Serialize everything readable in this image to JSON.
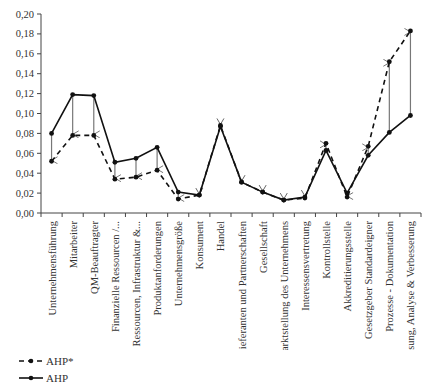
{
  "chart_data": {
    "type": "line",
    "title": "",
    "xlabel": "",
    "ylabel": "",
    "ylim": [
      0,
      0.2
    ],
    "yticks": [
      "0,00",
      "0,02",
      "0,04",
      "0,06",
      "0,08",
      "0,10",
      "0,12",
      "0,14",
      "0,16",
      "0,18",
      "0,20"
    ],
    "grid": false,
    "legend_position": "bottom-left",
    "categories": [
      "Unternehmensführung",
      "Mitarbeiter",
      "QM-Beauftragter",
      "Finanzielle Ressourcen /...",
      "Ressourcen, Infrastruktur &...",
      "Produktanforderungen",
      "Unternehmensgröße",
      "Konsument",
      "Handel",
      "Lieferanten und Partnerschaften",
      "Gesellschaft",
      "Marktstellung des Unternehmens",
      "Interessensvertretung",
      "Kontrollstelle",
      "Akkreditierungsstelle",
      "Gesetzgeber Standardeigner",
      "Prozesse - Dokumentation",
      "Messung, Analyse & Verbesserung"
    ],
    "series": [
      {
        "name": "AHP*",
        "style": "dashed",
        "values": [
          0.052,
          0.078,
          0.078,
          0.034,
          0.036,
          0.043,
          0.014,
          0.018,
          0.088,
          0.031,
          0.021,
          0.013,
          0.015,
          0.07,
          0.016,
          0.067,
          0.152,
          0.183
        ]
      },
      {
        "name": "AHP",
        "style": "solid",
        "values": [
          0.08,
          0.119,
          0.118,
          0.051,
          0.055,
          0.066,
          0.021,
          0.018,
          0.087,
          0.031,
          0.021,
          0.013,
          0.016,
          0.063,
          0.02,
          0.058,
          0.081,
          0.098
        ]
      }
    ],
    "annotations": "Arrows drawn from AHP to AHP* value at each category"
  },
  "legend": {
    "items": [
      {
        "label": "AHP*",
        "style": "dashed"
      },
      {
        "label": "AHP",
        "style": "solid"
      }
    ]
  }
}
